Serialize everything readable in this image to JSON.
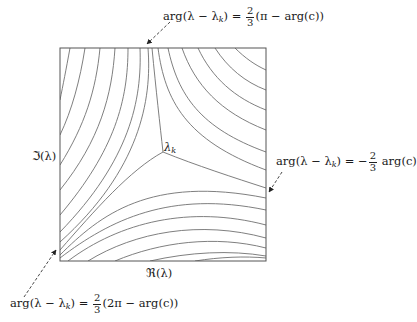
{
  "diagram": {
    "type": "contour-plot",
    "center_label": "λ",
    "center_label_sub": "k",
    "axis_x_label": "ℜ(λ)",
    "axis_y_label": "ℑ(λ)",
    "annotations": {
      "top": {
        "lhs": "arg(λ − λ",
        "lhs_sub": "k",
        "lhs_end": ") = ",
        "frac_num": "2",
        "frac_den": "3",
        "rhs": "(π − arg(c))"
      },
      "right": {
        "lhs": "arg(λ − λ",
        "lhs_sub": "k",
        "lhs_end": ") = −",
        "frac_num": "2",
        "frac_den": "3",
        "rhs": " arg(c)"
      },
      "bottom": {
        "lhs": "arg(λ − λ",
        "lhs_sub": "k",
        "lhs_end": ") = ",
        "frac_num": "2",
        "frac_den": "3",
        "rhs": "(2π − arg(c))"
      }
    },
    "colors": {
      "frame": "#555555",
      "curves": "#6a6a6a",
      "text": "#1a1a1a",
      "arrows": "#333333"
    }
  }
}
